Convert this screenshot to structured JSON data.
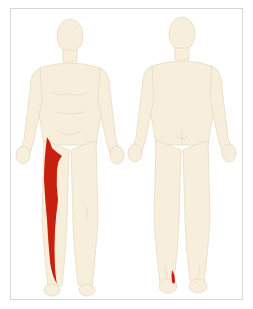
{
  "diagram": {
    "type": "referred-pain-body-chart",
    "views": [
      {
        "name": "anterior",
        "label": ""
      },
      {
        "name": "posterior",
        "label": ""
      }
    ],
    "colors": {
      "skin": "#f7efdc",
      "outline": "#e6dcc4",
      "pain": "#c8200f",
      "frame": "#d6d6d6",
      "background": "#ffffff"
    },
    "pain_regions": [
      {
        "view": "anterior",
        "area": "lateral thigh and lateral leg (right side of figure)"
      },
      {
        "view": "posterior",
        "area": "lateral heel / ankle (left foot of figure)"
      }
    ]
  }
}
